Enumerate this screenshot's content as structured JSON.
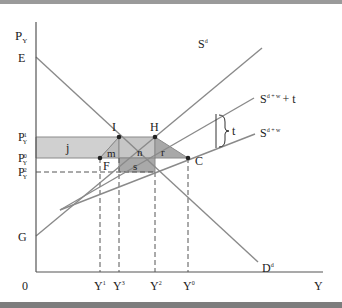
{
  "diagram": {
    "axes": {
      "y_label": "P",
      "y_label_sub": "Y",
      "x_label": "Y",
      "origin_label": "0"
    },
    "price_levels": [
      {
        "id": "p1",
        "base": "P",
        "sub": "Y",
        "sup": "1"
      },
      {
        "id": "p0",
        "base": "P",
        "sub": "Y",
        "sup": "0"
      },
      {
        "id": "p2",
        "base": "P",
        "sub": "Y",
        "sup": "2"
      }
    ],
    "quantity_levels": [
      {
        "id": "y1",
        "base": "Y",
        "sup": "1"
      },
      {
        "id": "y3",
        "base": "Y",
        "sup": "3"
      },
      {
        "id": "y2",
        "base": "Y",
        "sup": "2"
      },
      {
        "id": "y0",
        "base": "Y",
        "sup": "0"
      }
    ],
    "intercepts": {
      "E": "E",
      "G": "G"
    },
    "points": {
      "I": "I",
      "H": "H",
      "F": "F",
      "C": "C"
    },
    "areas": {
      "j": "j",
      "m": "m",
      "n": "n",
      "r": "r",
      "s": "s"
    },
    "curves": {
      "supply_domestic": {
        "base": "S",
        "sup": "d"
      },
      "supply_world_tariff": {
        "base": "S",
        "sup": "d + w",
        "suffix": "+ t"
      },
      "supply_world": {
        "base": "S",
        "sup": "d + w"
      },
      "demand": {
        "base": "D",
        "sup": "d"
      }
    },
    "tariff_label": "t",
    "colors": {
      "line": "#8a8a8a",
      "axis": "#555555",
      "shade_light": "#cfcfcf",
      "shade_mid": "#b5b5b5",
      "shade_dark": "#a3a3a3",
      "point": "#222222"
    }
  }
}
